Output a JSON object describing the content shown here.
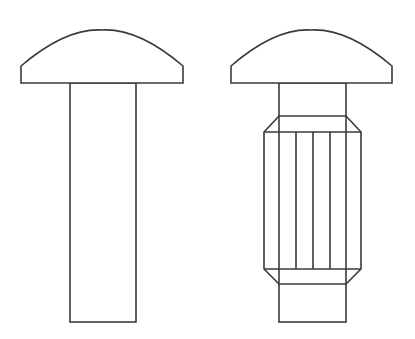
{
  "diagram": {
    "type": "technical-drawing",
    "colors": {
      "background": "#ffffff",
      "stroke": "#3a3a3a"
    },
    "figures": [
      {
        "name": "plain-rivet",
        "head": {
          "left": 21,
          "right": 183,
          "flat_y": 83,
          "edge_top_y": 66,
          "crown_x": 102,
          "crown_y": 30
        },
        "shaft": {
          "left": 70,
          "right": 136,
          "top": 83,
          "bottom": 322
        }
      },
      {
        "name": "knurled-rivet",
        "head": {
          "left": 231,
          "right": 392,
          "flat_y": 83,
          "edge_top_y": 66,
          "crown_x": 311,
          "crown_y": 30
        },
        "shaft": {
          "left": 279,
          "right": 346,
          "top": 83,
          "bottom": 322
        },
        "knurl": {
          "outer_left": 264,
          "outer_right": 361,
          "chamfer_top_y": 116,
          "straight_top_y": 132,
          "straight_bottom_y": 269,
          "chamfer_bottom_y": 284,
          "ridge_x": [
            296,
            313,
            330
          ]
        }
      }
    ]
  }
}
